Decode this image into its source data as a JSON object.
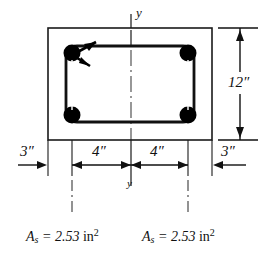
{
  "figure": {
    "kind": "reinforced-concrete-beam-cross-section",
    "colors": {
      "line": "#1a1a1a",
      "rebar": "#000000",
      "background": "#ffffff",
      "centerline": "#333333"
    },
    "axis": {
      "top_label": "y",
      "bottom_label": "y"
    },
    "dimensions": {
      "cover_left": "3″",
      "spacing_left": "4″",
      "spacing_right": "4″",
      "cover_right": "3″",
      "height": "12″"
    },
    "steel_labels": [
      {
        "symbol": "A",
        "subscript": "s",
        "equals": "=",
        "value": "2.53",
        "unit": "in",
        "exponent": "2"
      },
      {
        "symbol": "A",
        "subscript": "s",
        "equals": "=",
        "value": "2.53",
        "unit": "in",
        "exponent": "2"
      }
    ]
  }
}
